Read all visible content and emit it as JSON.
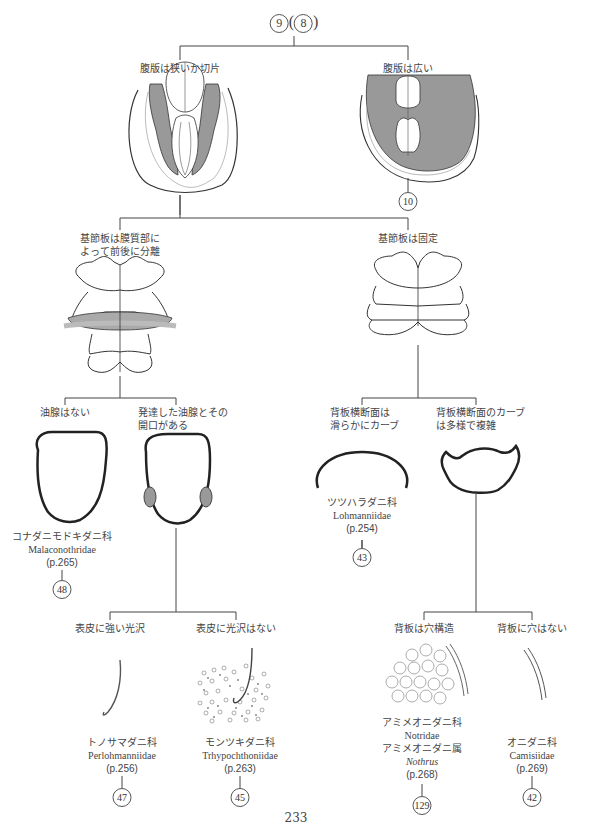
{
  "header": {
    "node_number": "9",
    "node_parent": "8"
  },
  "level1": {
    "left": {
      "label": "腹版は狭いか切片"
    },
    "right": {
      "label": "腹版は広い",
      "goto": "10"
    }
  },
  "level2": {
    "left": {
      "label_line1": "基節板は膜質部に",
      "label_line2": "よって前後に分離"
    },
    "right": {
      "label": "基節板は固定"
    }
  },
  "level3": {
    "a": {
      "label": "油腺はない",
      "family_ja": "コナダニモドキダニ科",
      "family_latin": "Malaconothridae",
      "page": "(p.265)",
      "goto": "48"
    },
    "b": {
      "label_line1": "発達した油腺とその",
      "label_line2": "開口がある"
    },
    "c": {
      "label_line1": "背板横断面は",
      "label_line2": "滑らかにカーブ",
      "family_ja": "ツツハラダニ科",
      "family_latin": "Lohmanniidae",
      "page": "(p.254)",
      "goto": "43"
    },
    "d": {
      "label_line1": "背板横断面のカーブ",
      "label_line2": "は多様で複雑"
    }
  },
  "level4": {
    "a": {
      "label": "表皮に強い光沢",
      "family_ja": "トノサマダニ科",
      "family_latin": "Perlohmanniidae",
      "page": "(p.256)",
      "goto": "47"
    },
    "b": {
      "label": "表皮に光沢はない",
      "family_ja": "モンツキダニ科",
      "family_latin": "Trhypochthoniidae",
      "page": "(p.263)",
      "goto": "45"
    },
    "c": {
      "label": "背板は穴構造",
      "family_ja": "アミメオニダニ科",
      "family_latin": "Notridae",
      "genus_ja": "アミメオニダニ属",
      "genus_latin": "Nothrus",
      "page": "(p.268)",
      "goto": "129"
    },
    "d": {
      "label": "背板に穴はない",
      "family_ja": "オニダニ科",
      "family_latin": "Camisiidae",
      "page": "(p.269)",
      "goto": "42"
    }
  },
  "footer": {
    "page_number": "233"
  },
  "colors": {
    "line": "#333333",
    "shade": "#999999",
    "light_shade": "#bbbbbb"
  }
}
